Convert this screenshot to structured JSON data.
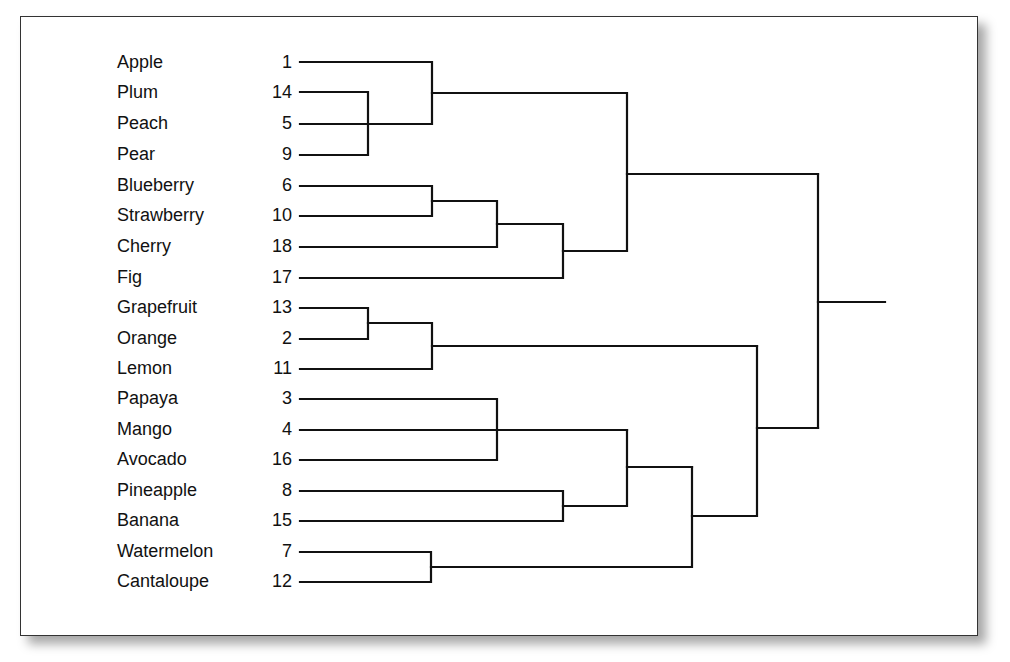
{
  "diagram": {
    "type": "dendrogram",
    "leaves": [
      {
        "name": "Apple",
        "id": "1"
      },
      {
        "name": "Plum",
        "id": "14"
      },
      {
        "name": "Peach",
        "id": "5"
      },
      {
        "name": "Pear",
        "id": "9"
      },
      {
        "name": "Blueberry",
        "id": "6"
      },
      {
        "name": "Strawberry",
        "id": "10"
      },
      {
        "name": "Cherry",
        "id": "18"
      },
      {
        "name": "Fig",
        "id": "17"
      },
      {
        "name": "Grapefruit",
        "id": "13"
      },
      {
        "name": "Orange",
        "id": "2"
      },
      {
        "name": "Lemon",
        "id": "11"
      },
      {
        "name": "Papaya",
        "id": "3"
      },
      {
        "name": "Mango",
        "id": "4"
      },
      {
        "name": "Avocado",
        "id": "16"
      },
      {
        "name": "Pineapple",
        "id": "8"
      },
      {
        "name": "Banana",
        "id": "15"
      },
      {
        "name": "Watermelon",
        "id": "7"
      },
      {
        "name": "Cantaloupe",
        "id": "12"
      }
    ],
    "clusters": [
      {
        "members": [
          "Plum",
          "Pear"
        ],
        "level": 1
      },
      {
        "members": [
          "Apple",
          "Peach",
          "Plum",
          "Pear"
        ],
        "level": 2
      },
      {
        "members": [
          "Blueberry",
          "Strawberry"
        ],
        "level": 2
      },
      {
        "members": [
          "Blueberry",
          "Strawberry",
          "Cherry"
        ],
        "level": 3
      },
      {
        "members": [
          "Blueberry",
          "Strawberry",
          "Cherry",
          "Fig"
        ],
        "level": 4
      },
      {
        "members": [
          "Apple",
          "Plum",
          "Peach",
          "Pear",
          "Blueberry",
          "Strawberry",
          "Cherry",
          "Fig"
        ],
        "level": 5
      },
      {
        "members": [
          "Grapefruit",
          "Orange"
        ],
        "level": 1
      },
      {
        "members": [
          "Grapefruit",
          "Orange",
          "Lemon"
        ],
        "level": 2
      },
      {
        "members": [
          "Papaya",
          "Avocado"
        ],
        "level": 3
      },
      {
        "members": [
          "Pineapple",
          "Banana"
        ],
        "level": 4
      },
      {
        "members": [
          "Papaya",
          "Mango",
          "Avocado",
          "Pineapple",
          "Banana"
        ],
        "level": 5
      },
      {
        "members": [
          "Watermelon",
          "Cantaloupe"
        ],
        "level": 2
      },
      {
        "members": [
          "Papaya",
          "Mango",
          "Avocado",
          "Pineapple",
          "Banana",
          "Watermelon",
          "Cantaloupe"
        ],
        "level": 6
      },
      {
        "members": [
          "Grapefruit",
          "Orange",
          "Lemon",
          "Papaya",
          "Mango",
          "Avocado",
          "Pineapple",
          "Banana",
          "Watermelon",
          "Cantaloupe"
        ],
        "level": 7
      },
      {
        "members": [
          "all"
        ],
        "level": 8
      }
    ],
    "line_color": "#111111"
  }
}
